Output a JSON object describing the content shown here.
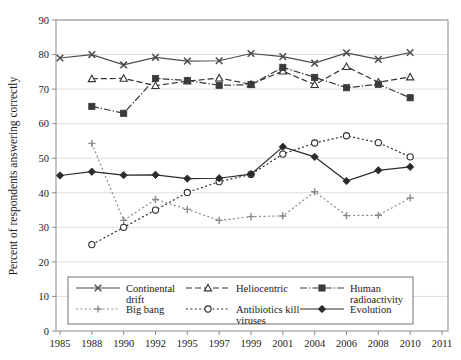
{
  "chart_data": {
    "type": "line",
    "title": "",
    "xlabel": "",
    "ylabel": "Percent of respondents answering correctly",
    "categories": [
      "1985",
      "1988",
      "1990",
      "1992",
      "1995",
      "1997",
      "1999",
      "2001",
      "2004",
      "2006",
      "2008",
      "2010",
      "2011"
    ],
    "xticklabels": [
      "1985",
      "1988",
      "1990",
      "1992",
      "1995",
      "1997",
      "1999",
      "2001",
      "2004",
      "2006",
      "2008",
      "2010",
      "2011"
    ],
    "yticklabels": [
      "0",
      "10",
      "20",
      "30",
      "40",
      "50",
      "60",
      "70",
      "80",
      "90"
    ],
    "yticks": [
      0,
      10,
      20,
      30,
      40,
      50,
      60,
      70,
      80,
      90
    ],
    "ylim": [
      0,
      90
    ],
    "grid": "horizontal",
    "legend_position": "lower-center-inside",
    "series": [
      {
        "name": "Continental drift",
        "legend_label": "Continental drift",
        "marker": "x",
        "dash": "solid",
        "color": "#4d4d4d",
        "x": [
          "1985",
          "1988",
          "1990",
          "1992",
          "1995",
          "1997",
          "1999",
          "2001",
          "2004",
          "2006",
          "2008",
          "2010"
        ],
        "values": [
          79.0,
          80.0,
          77.0,
          79.2,
          78.1,
          78.2,
          80.3,
          79.4,
          77.5,
          80.5,
          78.6,
          80.6
        ]
      },
      {
        "name": "Heliocentric",
        "legend_label": "Heliocentric",
        "marker": "triangle-open",
        "dash": "dashed",
        "color": "#333333",
        "x": [
          "1988",
          "1990",
          "1992",
          "1995",
          "1997",
          "1999",
          "2001",
          "2004",
          "2006",
          "2008",
          "2010"
        ],
        "values": [
          73.0,
          73.1,
          71.0,
          72.3,
          73.2,
          71.4,
          75.2,
          71.3,
          76.5,
          72.0,
          73.5
        ]
      },
      {
        "name": "Human radioactivity",
        "legend_label": "Human radioactivity",
        "marker": "square-filled",
        "dash": "dashdot",
        "color": "#3a3a3a",
        "x": [
          "1988",
          "1990",
          "1992",
          "1995",
          "1997",
          "1999",
          "2001",
          "2004",
          "2006",
          "2008",
          "2010"
        ],
        "values": [
          65.0,
          63.0,
          73.1,
          72.5,
          71.1,
          71.3,
          76.3,
          73.4,
          70.4,
          71.4,
          67.5
        ]
      },
      {
        "name": "Big bang",
        "legend_label": "Big bang",
        "marker": "plus",
        "dash": "dotted",
        "color": "#8a8a8a",
        "x": [
          "1988",
          "1990",
          "1992",
          "1995",
          "1997",
          "1999",
          "2001",
          "2004",
          "2006",
          "2008",
          "2010"
        ],
        "values": [
          54.3,
          32.0,
          38.1,
          35.2,
          32.0,
          33.1,
          33.3,
          40.3,
          33.4,
          33.5,
          38.5
        ]
      },
      {
        "name": "Antibiotics kill viruses",
        "legend_label": "Antibiotics kill viruses",
        "marker": "circle-open",
        "dash": "dotted",
        "color": "#2e2e2e",
        "x": [
          "1988",
          "1990",
          "1992",
          "1995",
          "1997",
          "1999",
          "2001",
          "2004",
          "2006",
          "2008",
          "2010"
        ],
        "values": [
          25.0,
          30.0,
          35.0,
          40.1,
          43.2,
          45.3,
          51.2,
          54.4,
          56.5,
          54.5,
          50.4
        ]
      },
      {
        "name": "Evolution",
        "legend_label": "Evolution",
        "marker": "diamond-filled",
        "dash": "solid",
        "color": "#2b2b2b",
        "x": [
          "1985",
          "1988",
          "1990",
          "1992",
          "1995",
          "1997",
          "1999",
          "2001",
          "2004",
          "2006",
          "2008",
          "2010"
        ],
        "values": [
          45.0,
          46.1,
          45.1,
          45.2,
          44.1,
          44.2,
          45.4,
          53.3,
          50.4,
          43.4,
          46.5,
          47.5
        ]
      }
    ]
  },
  "legend": {
    "items": [
      {
        "label_line1": "Continental",
        "label_line2": "drift",
        "key": "continental-drift"
      },
      {
        "label_line1": "Heliocentric",
        "label_line2": "",
        "key": "heliocentric"
      },
      {
        "label_line1": "Human",
        "label_line2": "radioactivity",
        "key": "human-radioactivity"
      },
      {
        "label_line1": "Big bang",
        "label_line2": "",
        "key": "big-bang"
      },
      {
        "label_line1": "Antibiotics kill",
        "label_line2": "viruses",
        "key": "antibiotics-kill-viruses"
      },
      {
        "label_line1": "Evolution",
        "label_line2": "",
        "key": "evolution"
      }
    ]
  },
  "colors": {
    "grid": "#d9d9d9",
    "frame": "#8c8c8c",
    "text": "#1a1a1a",
    "background": "#ffffff"
  }
}
